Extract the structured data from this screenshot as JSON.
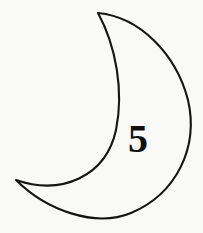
{
  "figure": {
    "kind": "crescent-moon-outline-with-number",
    "background_color": "#f9f9f7",
    "stroke_color": "#141414",
    "stroke_width": 2.1,
    "fill": "none",
    "canvas": {
      "width": 203,
      "height": 233
    }
  },
  "shape": {
    "name": "crescent-moon",
    "label": "crescent moon",
    "top_cusp": {
      "x": 98,
      "y": 13
    },
    "bottom_cusp": {
      "x": 16,
      "y": 180
    },
    "outer_arc_rightmost": {
      "x": 190,
      "y": 112
    },
    "outer_arc_bottom": {
      "x": 115,
      "y": 218
    },
    "inner_arc_points": [
      {
        "x": 98,
        "y": 13
      },
      {
        "x": 118,
        "y": 80
      },
      {
        "x": 104,
        "y": 132
      },
      {
        "x": 60,
        "y": 166
      },
      {
        "x": 16,
        "y": 180
      }
    ],
    "outer_arc_points": [
      {
        "x": 98,
        "y": 13
      },
      {
        "x": 155,
        "y": 40
      },
      {
        "x": 190,
        "y": 110
      },
      {
        "x": 160,
        "y": 186
      },
      {
        "x": 95,
        "y": 217
      },
      {
        "x": 16,
        "y": 180
      }
    ],
    "path": "M 98 13 C 140 17 176 54 188 100 C 199 148 176 194 131 213 C 95 228 46 210 16 180 C 62 196 106 176 116 130 C 124 91 116 46 98 13 Z"
  },
  "annotation": {
    "name": "number-label",
    "value": "5",
    "color": "#101010",
    "position": {
      "x": 138,
      "y": 152
    },
    "font_size_px": 40,
    "font_weight": "bold",
    "font_style": "serif"
  }
}
